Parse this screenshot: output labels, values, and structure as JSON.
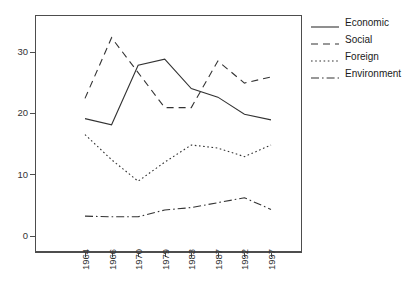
{
  "chart_data": {
    "type": "line",
    "title": "",
    "xlabel": "",
    "ylabel": "",
    "categories": [
      "1964",
      "1966",
      "1970",
      "1979",
      "1983",
      "1987",
      "1992",
      "1997"
    ],
    "ylim": [
      0,
      35
    ],
    "yticks": [
      0,
      10,
      20,
      30
    ],
    "grid": false,
    "legend_position": "right",
    "series": [
      {
        "name": "Economic",
        "style": "solid",
        "values": [
          19.3,
          18.3,
          28.0,
          29.0,
          24.2,
          22.8,
          20.0,
          19.1
        ]
      },
      {
        "name": "Social",
        "style": "dashed",
        "values": [
          22.6,
          32.5,
          26.8,
          21.1,
          21.1,
          28.7,
          25.1,
          26.1
        ]
      },
      {
        "name": "Foreign",
        "style": "dotted",
        "values": [
          16.7,
          12.6,
          9.1,
          12.2,
          15.0,
          14.5,
          13.1,
          15.0
        ]
      },
      {
        "name": "Environment",
        "style": "dashdot",
        "values": [
          3.4,
          3.3,
          3.3,
          4.4,
          4.8,
          5.6,
          6.4,
          4.5
        ]
      }
    ]
  },
  "axes": {
    "ytick_labels": [
      "30",
      "20",
      "10",
      "0"
    ],
    "xtick_labels": [
      "1964",
      "1966",
      "1970",
      "1979",
      "1983",
      "1987",
      "1992",
      "1997"
    ]
  },
  "legend": {
    "items": [
      {
        "label": "Economic"
      },
      {
        "label": "Social"
      },
      {
        "label": "Foreign"
      },
      {
        "label": "Environment"
      }
    ]
  },
  "colors": {
    "line": "#333333",
    "axis": "#4d4d4d",
    "text": "#333333",
    "background": "#ffffff"
  }
}
